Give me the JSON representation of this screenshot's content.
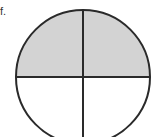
{
  "figure": {
    "label": "f.",
    "shape": "circle",
    "parts_total": 4,
    "parts_shaded": 2,
    "fraction_shaded": "2/4",
    "colors": {
      "shaded": "#d3d3d3",
      "unshaded": "#ffffff",
      "stroke": "#2a2a2a"
    }
  }
}
